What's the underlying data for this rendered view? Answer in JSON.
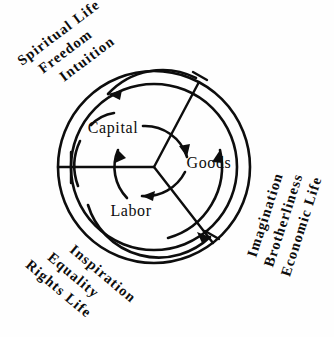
{
  "diagram": {
    "type": "circular-sector-diagram",
    "background_color": "#fefefe",
    "line_color": "#0d0d0d",
    "geometry": {
      "center_x": 154,
      "center_y": 167,
      "outer_radius": 96,
      "inner_radius": 83
    },
    "inner_labels": [
      {
        "id": "capital",
        "text": "Capital",
        "x": 113,
        "y": 133
      },
      {
        "id": "labor",
        "text": "Labor",
        "x": 131,
        "y": 216
      },
      {
        "id": "goods",
        "text": "Goods",
        "x": 209,
        "y": 168
      }
    ],
    "outer_label_groups": [
      {
        "id": "spiritual-life-group",
        "position": "upper-left",
        "rotation_deg": -37,
        "lines": [
          "Spiritual Life",
          "Freedom",
          "Intuition"
        ]
      },
      {
        "id": "economic-life-group",
        "position": "right",
        "rotation_deg": -72,
        "lines": [
          "Imagination",
          "Brotherliness",
          "Economic Life"
        ]
      },
      {
        "id": "rights-life-group",
        "position": "lower-left",
        "rotation_deg": 40,
        "lines": [
          "Inspiration",
          "Equality",
          "Rights Life"
        ]
      }
    ],
    "spokes": [
      {
        "id": "spoke-left",
        "angle_deg": 180
      },
      {
        "id": "spoke-upper-right",
        "angle_deg": -62
      },
      {
        "id": "spoke-lower-right",
        "angle_deg": 52
      }
    ],
    "flow_arrows": [
      {
        "id": "arc-outer-top",
        "direction": "counter-clockwise",
        "arrow_points": "left"
      },
      {
        "id": "arc-outer-bottom",
        "direction": "counter-clockwise",
        "arrow_points": "down-right"
      },
      {
        "id": "arc-outer-right",
        "direction": "counter-clockwise",
        "arrow_points": "up"
      },
      {
        "id": "arc-inner-capital",
        "direction": "clockwise",
        "arrow_points": "down-right"
      },
      {
        "id": "arc-inner-labor",
        "direction": "clockwise",
        "arrow_points": "left"
      },
      {
        "id": "arc-inner-goods",
        "direction": "clockwise",
        "arrow_points": "up"
      }
    ]
  }
}
